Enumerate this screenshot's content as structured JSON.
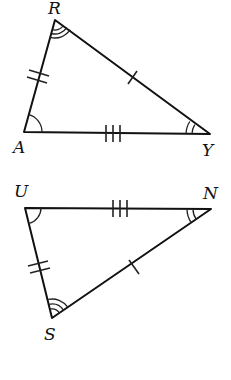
{
  "diagram": {
    "triangles": [
      {
        "name": "triangle-RAY",
        "vertices": {
          "R": {
            "label": "R",
            "x": 55,
            "y": 20,
            "angle_marks": 3
          },
          "A": {
            "label": "A",
            "x": 24,
            "y": 132,
            "angle_marks": 1
          },
          "Y": {
            "label": "Y",
            "x": 210,
            "y": 134,
            "angle_marks": 2
          }
        },
        "sides": [
          {
            "name": "RA",
            "tick_marks": 2
          },
          {
            "name": "RY",
            "tick_marks": 1
          },
          {
            "name": "AY",
            "tick_marks": 3
          }
        ]
      },
      {
        "name": "triangle-USN",
        "vertices": {
          "U": {
            "label": "U",
            "x": 25,
            "y": 208,
            "angle_marks": 1
          },
          "N": {
            "label": "N",
            "x": 211,
            "y": 209,
            "angle_marks": 2
          },
          "S": {
            "label": "S",
            "x": 52,
            "y": 318,
            "angle_marks": 3
          }
        },
        "sides": [
          {
            "name": "US",
            "tick_marks": 2
          },
          {
            "name": "NS",
            "tick_marks": 1
          },
          {
            "name": "UN",
            "tick_marks": 3
          }
        ]
      }
    ],
    "labels": {
      "R": "R",
      "A": "A",
      "Y": "Y",
      "U": "U",
      "N": "N",
      "S": "S"
    },
    "colors": {
      "line": "#111111",
      "background": "#ffffff"
    }
  }
}
